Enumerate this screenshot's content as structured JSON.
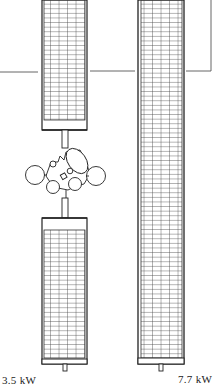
{
  "diagram": {
    "title": "",
    "configurations": [
      {
        "id": "left",
        "label": "3.5 kW",
        "description": "Satellite body with two shorter solar array wings (upper and lower)",
        "components": [
          "upper-solar-wing",
          "body-with-antennas",
          "lower-solar-wing"
        ]
      },
      {
        "id": "right",
        "label": "7.7 kW",
        "description": "Single long solar array wing"
      }
    ],
    "colors": {
      "line": "#222222",
      "grid": "#444444",
      "background": "#ffffff"
    }
  }
}
